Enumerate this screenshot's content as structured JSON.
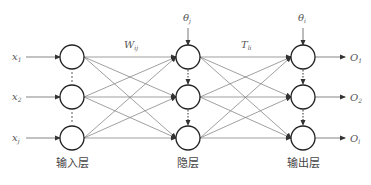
{
  "diagram": {
    "type": "feedforward-neural-network",
    "layers": [
      {
        "id": "input",
        "label": "输入层",
        "x": 72,
        "nodes": [
          {
            "y": 57,
            "input_label": "x",
            "input_sub": "1"
          },
          {
            "y": 97,
            "input_label": "x",
            "input_sub": "2"
          },
          {
            "y": 138,
            "input_label": "x",
            "input_sub": "j"
          }
        ]
      },
      {
        "id": "hidden",
        "label": "隐层",
        "x": 188,
        "bias_label": "θ",
        "bias_sub": "j",
        "nodes": [
          {
            "y": 57
          },
          {
            "y": 97
          },
          {
            "y": 138
          }
        ]
      },
      {
        "id": "output",
        "label": "输出层",
        "x": 303,
        "bias_label": "θ",
        "bias_sub": "i",
        "nodes": [
          {
            "y": 57,
            "output_label": "O",
            "output_sub": "1"
          },
          {
            "y": 97,
            "output_label": "O",
            "output_sub": "2"
          },
          {
            "y": 138,
            "output_label": "O",
            "output_sub": "l"
          }
        ]
      }
    ],
    "weights": [
      {
        "label": "W",
        "sub": "ij",
        "between": [
          "input",
          "hidden"
        ]
      },
      {
        "label": "T",
        "sub": "li",
        "between": [
          "hidden",
          "output"
        ]
      }
    ],
    "ellipsis_glyph": "⋮",
    "colors": {
      "stroke": "#333333",
      "edge": "#666666",
      "text": "#555555"
    }
  }
}
